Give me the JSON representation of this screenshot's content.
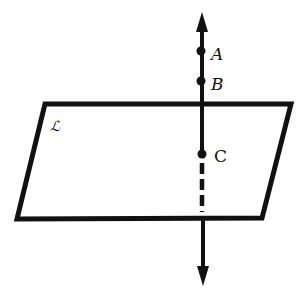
{
  "diagram": {
    "type": "geometry-line-through-plane",
    "stroke_color": "#111111",
    "background": "#ffffff",
    "plane": {
      "label": "ℒ",
      "corners": {
        "top_left": [
          45,
          104
        ],
        "top_right": [
          291,
          104
        ],
        "bottom_right": [
          262,
          218
        ],
        "bottom_left": [
          17,
          219
        ]
      }
    },
    "line": {
      "x": 202,
      "top_arrow_tip_y": 12,
      "bottom_arrow_tip_y": 284,
      "hidden_segment": {
        "from_y": 160,
        "to_y": 216,
        "style": "dashed"
      }
    },
    "points": [
      {
        "name": "A",
        "label": "A",
        "x": 201,
        "y": 51,
        "label_x": 212,
        "label_y": 59,
        "italic": true
      },
      {
        "name": "B",
        "label": "B",
        "x": 201,
        "y": 81,
        "label_x": 212,
        "label_y": 89,
        "italic": true
      },
      {
        "name": "C",
        "label": "C",
        "x": 202,
        "y": 154,
        "label_x": 214,
        "label_y": 161,
        "italic": false
      }
    ]
  }
}
